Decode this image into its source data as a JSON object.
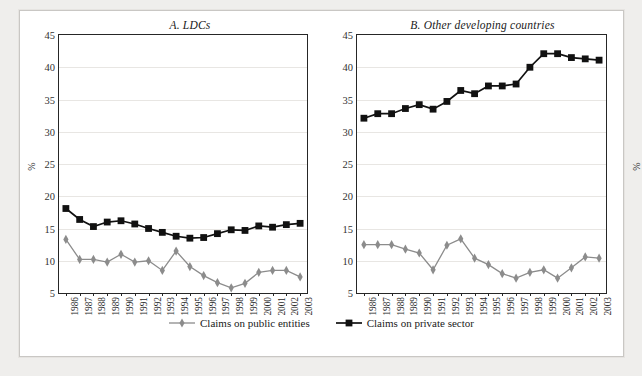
{
  "chart_data": [
    {
      "type": "line",
      "title": "A. LDCs",
      "xlabel": "",
      "ylabel": "%",
      "ylim": [
        5,
        45
      ],
      "ytick_step": 5,
      "yticks": [
        5,
        10,
        15,
        20,
        25,
        30,
        35,
        40,
        45
      ],
      "grid": true,
      "legend_position": "bottom",
      "categories": [
        "1986",
        "1987",
        "1988",
        "1989",
        "1990",
        "1991",
        "1992",
        "1993",
        "1994",
        "1995",
        "1996",
        "1997",
        "1998",
        "1999",
        "2000",
        "2001",
        "2002",
        "2003"
      ],
      "series": [
        {
          "name": "Claims on public entities",
          "marker": "diamond",
          "color": "#8c8c8c",
          "values": [
            13.3,
            10.2,
            10.2,
            9.8,
            11.0,
            9.8,
            10.0,
            8.5,
            11.5,
            9.1,
            7.7,
            6.6,
            5.8,
            6.5,
            8.2,
            8.5,
            8.5,
            7.5
          ]
        },
        {
          "name": "Claims on private sector",
          "marker": "square",
          "color": "#111111",
          "values": [
            18.1,
            16.4,
            15.3,
            16.0,
            16.2,
            15.7,
            15.0,
            14.4,
            13.8,
            13.5,
            13.6,
            14.2,
            14.8,
            14.7,
            15.4,
            15.2,
            15.6,
            15.8
          ]
        }
      ]
    },
    {
      "type": "line",
      "title": "B. Other developing countries",
      "xlabel": "",
      "ylabel": "%",
      "ylim": [
        5,
        45
      ],
      "ytick_step": 5,
      "yticks": [
        5,
        10,
        15,
        20,
        25,
        30,
        35,
        40,
        45
      ],
      "grid": true,
      "legend_position": "bottom",
      "categories": [
        "1986",
        "1987",
        "1988",
        "1989",
        "1990",
        "1991",
        "1992",
        "1993",
        "1994",
        "1995",
        "1996",
        "1997",
        "1998",
        "1999",
        "2000",
        "2001",
        "2002",
        "2003"
      ],
      "series": [
        {
          "name": "Claims on public entities",
          "marker": "diamond",
          "color": "#8c8c8c",
          "values": [
            12.5,
            12.5,
            12.5,
            11.8,
            11.2,
            8.6,
            12.4,
            13.4,
            10.4,
            9.4,
            8.0,
            7.3,
            8.2,
            8.6,
            7.3,
            8.9,
            10.6,
            10.4
          ]
        },
        {
          "name": "Claims on private sector",
          "marker": "square",
          "color": "#111111",
          "values": [
            32.1,
            32.8,
            32.8,
            33.6,
            34.2,
            33.5,
            34.7,
            36.4,
            35.9,
            37.1,
            37.1,
            37.4,
            40.0,
            42.1,
            42.1,
            41.5,
            41.3,
            41.1
          ]
        }
      ]
    }
  ],
  "legend": {
    "entries": [
      {
        "label": "Claims on public entities",
        "marker": "diamond",
        "color": "#8c8c8c"
      },
      {
        "label": "Claims on private sector",
        "marker": "square",
        "color": "#111111"
      }
    ]
  }
}
